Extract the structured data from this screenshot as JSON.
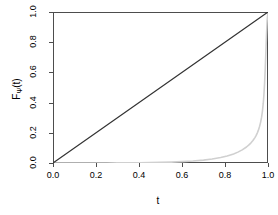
{
  "chart_data": {
    "type": "line",
    "title": "",
    "xlabel": "t",
    "ylabel_main": "F",
    "ylabel_sub": "Ψ",
    "ylabel_tail": "(t)",
    "ylabel_full": "FΨ(t)",
    "xlim": [
      0.0,
      1.0
    ],
    "ylim": [
      0.0,
      1.0
    ],
    "grid": false,
    "legend": "none",
    "xticks": [
      "0.0",
      "0.2",
      "0.4",
      "0.6",
      "0.8",
      "1.0"
    ],
    "xtick_values": [
      0.0,
      0.2,
      0.4,
      0.6,
      0.8,
      1.0
    ],
    "yticks": [
      "0.0",
      "0.2",
      "0.4",
      "0.6",
      "0.8",
      "1.0"
    ],
    "ytick_values": [
      0.0,
      0.2,
      0.4,
      0.6,
      0.8,
      1.0
    ],
    "series": [
      {
        "name": "diagonal-reference-line",
        "color": "#333333",
        "width": 1.2,
        "x": [
          0.0,
          1.0
        ],
        "values": [
          0.0,
          1.0
        ]
      },
      {
        "name": "cdf-curve",
        "color": "#d0d0d0",
        "width": 1.6,
        "x": [
          0.0,
          0.05,
          0.1,
          0.15,
          0.2,
          0.25,
          0.3,
          0.35,
          0.4,
          0.45,
          0.5,
          0.55,
          0.6,
          0.65,
          0.7,
          0.74,
          0.78,
          0.81,
          0.84,
          0.86,
          0.88,
          0.9,
          0.91,
          0.92,
          0.93,
          0.94,
          0.945,
          0.95,
          0.955,
          0.96,
          0.965,
          0.97,
          0.974,
          0.978,
          0.981,
          0.984,
          0.987,
          0.99,
          0.993,
          0.996,
          1.0
        ],
        "values": [
          0.0,
          0.0,
          0.0,
          0.0,
          0.0,
          0.0,
          0.001,
          0.001,
          0.002,
          0.003,
          0.004,
          0.006,
          0.009,
          0.013,
          0.019,
          0.026,
          0.036,
          0.046,
          0.06,
          0.072,
          0.087,
          0.106,
          0.118,
          0.132,
          0.149,
          0.17,
          0.183,
          0.198,
          0.216,
          0.238,
          0.266,
          0.302,
          0.342,
          0.396,
          0.452,
          0.524,
          0.618,
          0.73,
          0.848,
          0.945,
          1.0
        ]
      }
    ]
  }
}
